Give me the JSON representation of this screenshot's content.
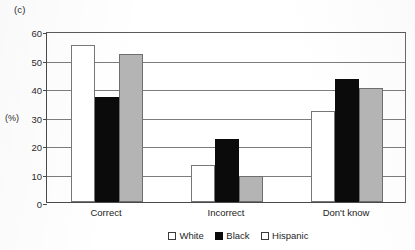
{
  "panel_label": "(c)",
  "yaxis_unit": "(%)",
  "legend": [
    {
      "label": "White",
      "swatch": "hollow-square-icon"
    },
    {
      "label": "Black",
      "swatch": "filled-square-icon"
    },
    {
      "label": "Hispanic",
      "swatch": "hollow-square-icon"
    }
  ],
  "chart_data": {
    "type": "bar",
    "title": "(c)",
    "xlabel": "",
    "ylabel": "(%)",
    "ylim": [
      0,
      60
    ],
    "yticks": [
      0,
      10,
      20,
      30,
      40,
      50,
      60
    ],
    "grid": true,
    "legend_position": "bottom",
    "categories": [
      "Correct",
      "Incorrect",
      "Don't know"
    ],
    "series": [
      {
        "name": "White",
        "color": "#ffffff",
        "values": [
          55,
          13,
          32
        ]
      },
      {
        "name": "Black",
        "color": "#0b0b0b",
        "values": [
          37,
          22,
          43
        ]
      },
      {
        "name": "Hispanic",
        "color": "#b4b4b4",
        "values": [
          52,
          9,
          40
        ]
      }
    ]
  }
}
